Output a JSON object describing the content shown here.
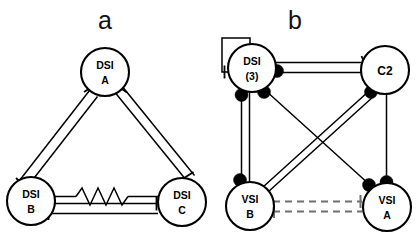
{
  "figure": {
    "background_color": "#ffffff",
    "line_color": "#000000",
    "dashed_line_color": "#6f6f6f",
    "width": 416,
    "height": 236
  },
  "panels": [
    {
      "letter": "a",
      "letter_x": 105,
      "letter_y": 28,
      "nodes": [
        {
          "id": "dsi-a",
          "line1": "DSI",
          "line2": "A",
          "cx": 105,
          "cy": 72,
          "r": 24
        },
        {
          "id": "dsi-b",
          "line1": "DSI",
          "line2": "B",
          "cx": 31,
          "cy": 201,
          "r": 24
        },
        {
          "id": "dsi-c",
          "line1": "DSI",
          "line2": "C",
          "cx": 182,
          "cy": 202,
          "r": 24
        }
      ],
      "connections": [
        {
          "from": "dsi-a",
          "to": "dsi-b",
          "type": "inhibitory",
          "style": "solid"
        },
        {
          "from": "dsi-b",
          "to": "dsi-a",
          "type": "inhibitory",
          "style": "solid"
        },
        {
          "from": "dsi-a",
          "to": "dsi-c",
          "type": "inhibitory",
          "style": "solid"
        },
        {
          "from": "dsi-c",
          "to": "dsi-a",
          "type": "inhibitory",
          "style": "solid"
        },
        {
          "from": "dsi-b",
          "to": "dsi-c",
          "type": "electrical",
          "style": "solid"
        },
        {
          "from": "dsi-c",
          "to": "dsi-b",
          "type": "inhibitory",
          "style": "solid"
        }
      ]
    },
    {
      "letter": "b",
      "letter_x": 295,
      "letter_y": 28,
      "nodes": [
        {
          "id": "dsi-3",
          "line1": "DSI",
          "line2": "(3)",
          "cx": 252,
          "cy": 68,
          "r": 24
        },
        {
          "id": "c2",
          "line1": "C2",
          "line2": "",
          "cx": 385,
          "cy": 70,
          "r": 24
        },
        {
          "id": "vsi-b",
          "line1": "VSI",
          "line2": "B",
          "cx": 250,
          "cy": 206,
          "r": 24
        },
        {
          "id": "vsi-a",
          "line1": "VSI",
          "line2": "A",
          "cx": 387,
          "cy": 207,
          "r": 24
        }
      ],
      "connections": [
        {
          "from": "dsi-3",
          "to": "dsi-3",
          "type": "inhibitory",
          "style": "self-loop"
        },
        {
          "from": "dsi-3",
          "to": "c2",
          "type": "inhibitory",
          "style": "solid"
        },
        {
          "from": "c2",
          "to": "dsi-3",
          "type": "excitatory",
          "style": "solid"
        },
        {
          "from": "dsi-3",
          "to": "vsi-b",
          "type": "excitatory",
          "style": "solid"
        },
        {
          "from": "vsi-b",
          "to": "dsi-3",
          "type": "excitatory",
          "style": "solid"
        },
        {
          "from": "c2",
          "to": "vsi-a",
          "type": "excitatory",
          "style": "solid"
        },
        {
          "from": "dsi-3",
          "to": "vsi-a",
          "type": "excitatory",
          "style": "solid"
        },
        {
          "from": "c2",
          "to": "vsi-b",
          "type": "inhibitory",
          "style": "solid"
        },
        {
          "from": "vsi-b",
          "to": "vsi-a",
          "type": "inhibitory",
          "style": "dashed"
        },
        {
          "from": "vsi-a",
          "to": "vsi-b",
          "type": "inhibitory",
          "style": "dashed"
        }
      ]
    }
  ],
  "legend_symbols": {
    "excitatory": "filled-circle",
    "inhibitory": "t-bar",
    "electrical": "zigzag-resistor"
  }
}
